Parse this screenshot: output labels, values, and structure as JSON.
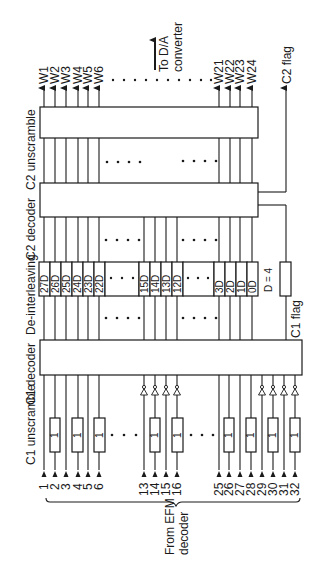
{
  "diagram": {
    "title_labels": {
      "c2_unscramble": "C2 unscramble",
      "c2_decoder": "C2 decoder",
      "deinterleaving": "De-interleaving",
      "c1_decoder": "C1 decoder",
      "c1_unscramble": "C1 unscramble",
      "to_da": "To D/A",
      "converter": "converter",
      "c2_flag": "C2 flag",
      "c1_flag": "C1 flag",
      "delay_param": "D = 4",
      "from_efm_1": "From EFM",
      "from_efm_2": "decoder",
      "unscramble_delay": "1",
      "ellipsis": "• • • •"
    },
    "outputs": [
      "W1",
      "W2",
      "W3",
      "W4",
      "W5",
      "W6",
      "W21",
      "W22",
      "W23",
      "W24"
    ],
    "inputs": [
      "1",
      "2",
      "3",
      "4",
      "5",
      "6",
      "13",
      "14",
      "15",
      "16",
      "25",
      "26",
      "27",
      "28",
      "29",
      "30",
      "31",
      "32"
    ],
    "delays": [
      "27D",
      "26D",
      "25D",
      "24D",
      "23D",
      "22D",
      "15D",
      "14D",
      "13D",
      "12D",
      "3D",
      "2D",
      "1D",
      "0D"
    ],
    "colors": {
      "line": "#1a1a1a",
      "background": "#ffffff"
    }
  }
}
